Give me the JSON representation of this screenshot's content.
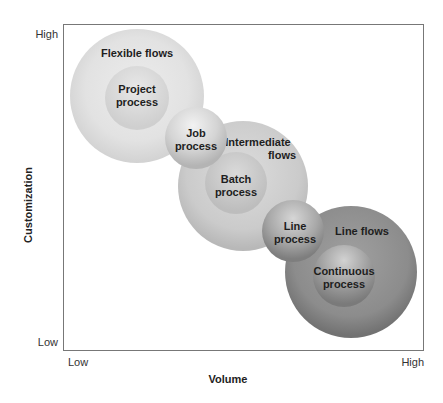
{
  "diagram": {
    "x_axis": {
      "label": "Volume",
      "low": "Low",
      "high": "High"
    },
    "y_axis": {
      "label": "Customization",
      "low": "Low",
      "high": "High"
    },
    "flows": [
      {
        "name": "Flexible flows",
        "process": [
          "Project",
          "process"
        ],
        "flow_lines": [
          "Flexible flows"
        ]
      },
      {
        "name": "Intermediate flows",
        "process": [
          "Batch",
          "process"
        ],
        "flow_lines": [
          "Intermediate",
          "flows"
        ]
      },
      {
        "name": "Line flows",
        "process": [
          "Continuous",
          "process"
        ],
        "flow_lines": [
          "Line flows"
        ]
      }
    ],
    "bridges": [
      {
        "name": "Job process",
        "lines": [
          "Job",
          "process"
        ]
      },
      {
        "name": "Line process",
        "lines": [
          "Line",
          "process"
        ]
      }
    ],
    "colors": {
      "light": "#e2e2e2",
      "mid": "#cfcfcf",
      "dark": "#8a8a8a",
      "frame": "#777777"
    }
  }
}
